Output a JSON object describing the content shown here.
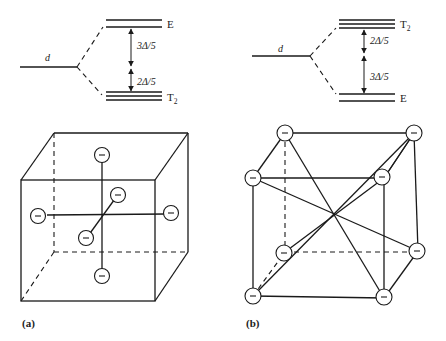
{
  "figure": {
    "panel_a": {
      "label": "(a)",
      "geometry": "octahedral",
      "level_diagram": {
        "parent_label": "d",
        "upper_level": {
          "label": "E",
          "subscript": "",
          "degeneracy": 2
        },
        "lower_level": {
          "label": "T",
          "subscript": "2",
          "degeneracy": 3
        },
        "upper_gap_label": "3Δ/5",
        "lower_gap_label": "2Δ/5"
      },
      "ligand_charge_symbol": "–",
      "ligand_count": 6
    },
    "panel_b": {
      "label": "(b)",
      "geometry": "tetrahedral",
      "level_diagram": {
        "parent_label": "d",
        "upper_level": {
          "label": "T",
          "subscript": "2",
          "degeneracy": 3
        },
        "lower_level": {
          "label": "E",
          "subscript": "",
          "degeneracy": 2
        },
        "upper_gap_label": "2Δ/5",
        "lower_gap_label": "3Δ/5"
      },
      "ligand_charge_symbol": "–",
      "ligand_count": 8
    }
  }
}
